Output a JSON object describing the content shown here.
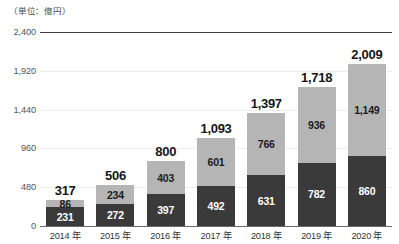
{
  "caption": "（単位：億円）",
  "colors": {
    "segment_bottom": "#3a3a3a",
    "segment_top": "#b5b5b5",
    "gridline": "#ededed",
    "axis": "#6b6b6b",
    "background": "#ffffff"
  },
  "chart_data": {
    "type": "bar",
    "title": "",
    "subtitle": "",
    "xlabel": "",
    "ylabel": "（単位：億円）",
    "ylim": [
      0,
      2400
    ],
    "yticks": [
      0,
      480,
      960,
      1440,
      1920,
      2400
    ],
    "ytick_labels": [
      "0",
      "480",
      "960",
      "1,440",
      "1,920",
      "2,400"
    ],
    "grid": true,
    "legend": "none",
    "stacked": true,
    "categories": [
      "2014 年",
      "2015 年",
      "2016 年",
      "2017 年",
      "2018 年",
      "2019 年",
      "2020 年"
    ],
    "series": [
      {
        "name": "下段",
        "color": "#3a3a3a",
        "values": [
          231,
          272,
          397,
          492,
          631,
          782,
          860
        ],
        "labels": [
          "231",
          "272",
          "397",
          "492",
          "631",
          "782",
          "860"
        ]
      },
      {
        "name": "上段",
        "color": "#b5b5b5",
        "values": [
          86,
          234,
          403,
          601,
          766,
          936,
          1149
        ],
        "labels": [
          "86",
          "234",
          "403",
          "601",
          "766",
          "936",
          "1,149"
        ]
      }
    ],
    "totals": [
      317,
      506,
      800,
      1093,
      1397,
      1718,
      2009
    ],
    "total_labels": [
      "317",
      "506",
      "800",
      "1,093",
      "1,397",
      "1,718",
      "2,009"
    ]
  }
}
